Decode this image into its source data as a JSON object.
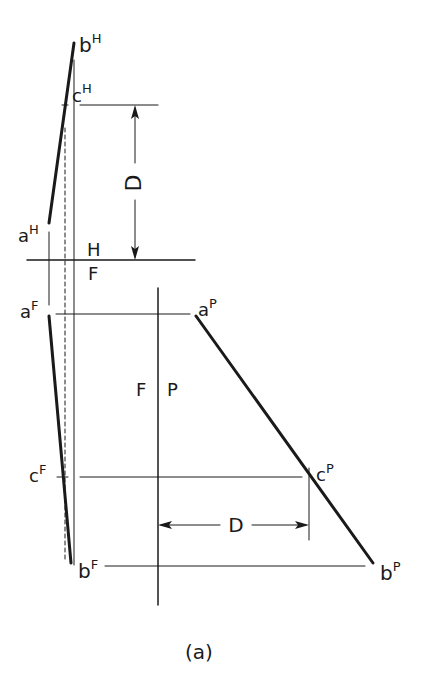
{
  "figure": {
    "caption": "(a)",
    "ink_color": "#1a1a1a",
    "background": "#ffffff"
  },
  "labels": {
    "bH": {
      "base": "b",
      "sup": "H"
    },
    "cH": {
      "base": "c",
      "sup": "H"
    },
    "aH": {
      "base": "a",
      "sup": "H"
    },
    "aF": {
      "base": "a",
      "sup": "F"
    },
    "cF": {
      "base": "c",
      "sup": "F"
    },
    "bF": {
      "base": "b",
      "sup": "F"
    },
    "aP": {
      "base": "a",
      "sup": "P"
    },
    "cP": {
      "base": "c",
      "sup": "P"
    },
    "bP": {
      "base": "b",
      "sup": "P"
    }
  },
  "folding_lines": {
    "hf_top": "H",
    "hf_bottom": "F",
    "fp_left": "F",
    "fp_right": "P"
  },
  "dimensions": {
    "vertical_D": "D",
    "horizontal_D": "D"
  }
}
